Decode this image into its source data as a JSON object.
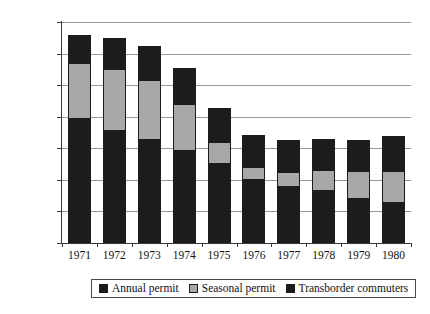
{
  "chart_data": {
    "type": "bar",
    "subtype": "stacked-vertical-bar",
    "title": "",
    "subtitle": "",
    "xlabel": "",
    "ylabel": "",
    "categories": [
      "1971",
      "1972",
      "1973",
      "1974",
      "1975",
      "1976",
      "1977",
      "1978",
      "1979",
      "1980"
    ],
    "series": [
      {
        "name": "Annual permit",
        "color": "#1c1c1c",
        "values": [
          393000,
          355000,
          325000,
          290000,
          250000,
          200000,
          178000,
          165000,
          138000,
          128000
        ]
      },
      {
        "name": "Seasonal permit",
        "color": "#a8a8a8",
        "values": [
          177000,
          195000,
          190000,
          150000,
          70000,
          40000,
          47000,
          65000,
          90000,
          100000
        ]
      },
      {
        "name": "Transborder commuters",
        "color": "#1c1c1c",
        "values": [
          90000,
          100000,
          110000,
          115000,
          108000,
          103000,
          100000,
          100000,
          97000,
          110000
        ]
      }
    ],
    "totals": [
      660000,
      650000,
      625000,
      555000,
      428000,
      343000,
      325000,
      330000,
      325000,
      338000
    ],
    "ylim": [
      0,
      700000
    ],
    "ytick_step": 100000,
    "yticks": [
      0,
      100000,
      200000,
      300000,
      400000,
      500000,
      600000,
      700000
    ],
    "ytick_labels": [
      "0",
      "100000",
      "200000",
      "300000",
      "400000",
      "500000",
      "600000",
      "700000"
    ],
    "grid": "horizontal",
    "legend_position": "bottom",
    "legend": [
      "Annual permit",
      "Seasonal permit",
      "Transborder commuters"
    ]
  },
  "legend": {
    "items": [
      {
        "label": "Annual permit",
        "swatch": "dark"
      },
      {
        "label": "Seasonal permit",
        "swatch": "gray"
      },
      {
        "label": "Transborder commuters",
        "swatch": "dark"
      }
    ]
  },
  "colors": {
    "annual": "#1c1c1c",
    "seasonal": "#a8a8a8",
    "transborder": "#1c1c1c",
    "gridline": "#9a9a9a",
    "axis": "#3a3a3a",
    "background": "#ffffff",
    "text": "#111111"
  }
}
